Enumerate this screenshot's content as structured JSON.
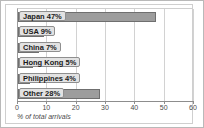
{
  "chart_data": {
    "type": "bar",
    "orientation": "horizontal",
    "title": "",
    "xlabel": "% of total arrivals",
    "ylabel": "",
    "xlim": [
      0,
      60
    ],
    "xticks": [
      0,
      10,
      20,
      30,
      40,
      50,
      60
    ],
    "xtick_labels": [
      "0",
      "10",
      "20",
      "30",
      "40",
      "50",
      "60"
    ],
    "grid": true,
    "legend": false,
    "categories": [
      "Japan",
      "USA",
      "China",
      "Hong Kong",
      "Philippines",
      "Other"
    ],
    "values": [
      47,
      9,
      7,
      5,
      4,
      28
    ],
    "bar_labels": [
      "Japan 47%",
      "USA 9%",
      "China 7%",
      "Hong Kong 5%",
      "Philippines 4%",
      "Other 28%"
    ],
    "colors": {
      "bar_fill": "#9d9d9d",
      "bar_border": "#6f6f6f",
      "label_box": "#e2e2e2",
      "label_border": "#8f8f8f",
      "gridline": "#d2d2d2",
      "axis": "#8d8d8d",
      "background": "#ffffff"
    }
  }
}
